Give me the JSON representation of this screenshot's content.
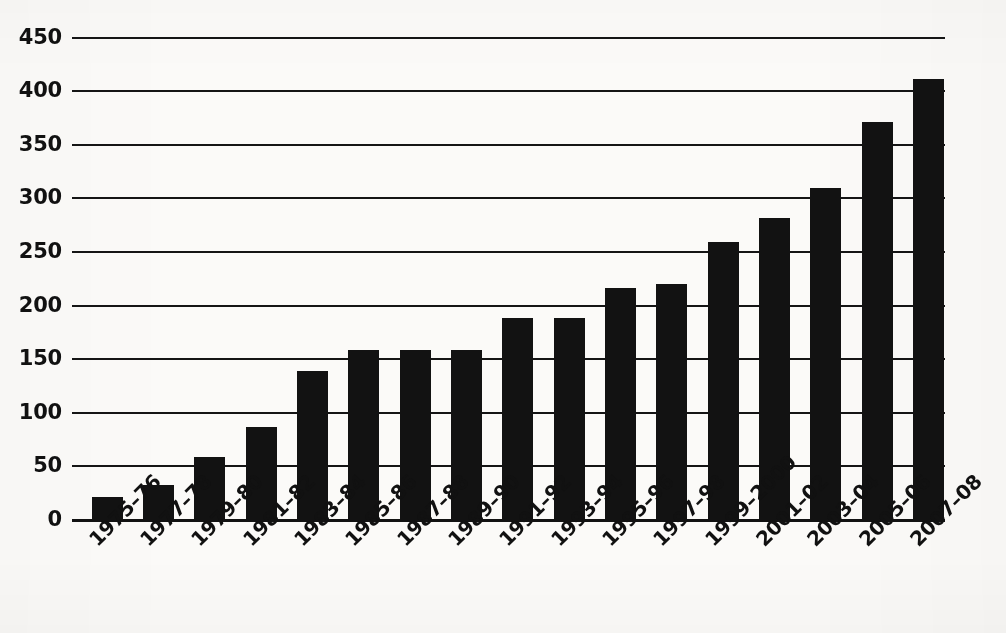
{
  "chart_data": {
    "type": "bar",
    "title": "",
    "subtitle": "",
    "xlabel": "",
    "ylabel": "",
    "ylim": [
      0,
      450
    ],
    "ytick_step": 50,
    "grid": true,
    "grid_axis": "y",
    "legend": false,
    "legend_position": "none",
    "bar_color": "#121212",
    "background_color": "#fbfaf8",
    "axis_color": "#121212",
    "xtick_rotation": -45,
    "categories": [
      "1975–76",
      "1977–78",
      "1979–80",
      "1981–82",
      "1983–84",
      "1985–86",
      "1987–88",
      "1989–90",
      "1991–92",
      "1993–94",
      "1995–96",
      "1997–98",
      "1999–2000",
      "2001–02",
      "2003–04",
      "2005–06",
      "2007–08"
    ],
    "values": [
      21,
      33,
      59,
      87,
      139,
      158,
      158,
      158,
      188,
      188,
      216,
      220,
      259,
      281,
      309,
      371,
      411
    ],
    "ytick_labels": [
      "450",
      "400",
      "350",
      "300",
      "250",
      "200",
      "150",
      "100",
      "50",
      "0"
    ],
    "ytick_values": [
      450,
      400,
      350,
      300,
      250,
      200,
      150,
      100,
      50,
      0
    ]
  }
}
